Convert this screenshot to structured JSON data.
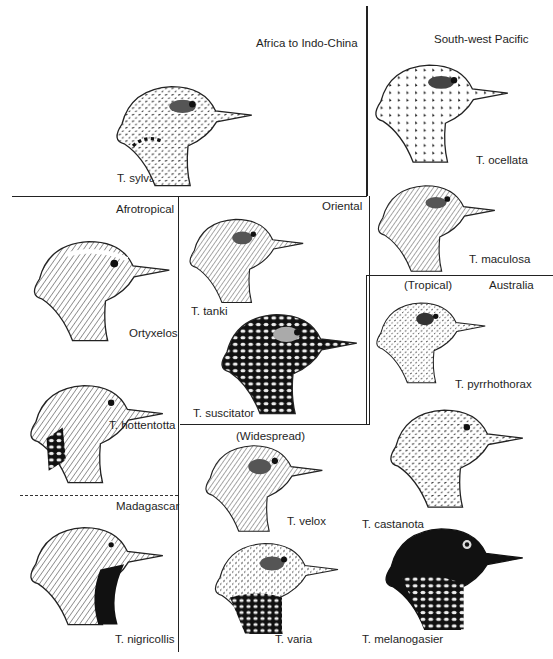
{
  "regions": {
    "africa_indochina": "Africa to Indo-China",
    "southwest_pacific": "South-west Pacific",
    "afrotropical": "Afrotropical",
    "oriental": "Oriental",
    "tropical": "(Tropical)",
    "australia": "Australia",
    "widespread": "(Widespread)",
    "madagascar": "Madagascar"
  },
  "species": {
    "sylvatica": "T. sylvatica",
    "ocellata": "T. ocellata",
    "maculosa": "T. maculosa",
    "ortyxelos": "Ortyxelos",
    "tanki": "T. tanki",
    "suscitator": "T. suscitator",
    "pyrrhothorax": "T. pyrrhothorax",
    "hottentotta": "T. hottentotta",
    "velox": "T. velox",
    "castanota": "T. castanota",
    "nigricollis": "T. nigricollis",
    "varia": "T. varia",
    "melanogasier": "T. melanogasier"
  }
}
